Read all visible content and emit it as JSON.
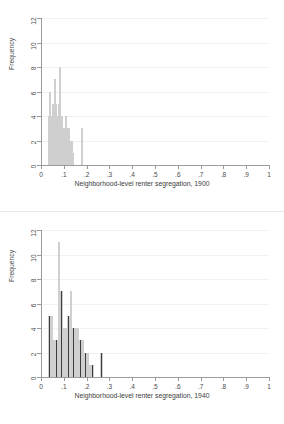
{
  "figure": {
    "background_color": "#ffffff",
    "bar_color": "#3d3d3d",
    "axis_color": "#9a9a9a",
    "grid_color": "#f1f1f1"
  },
  "panels": [
    {
      "name": "histogram-1900",
      "ylabel": "Frequency",
      "xtitle": "Neighborhood-level renter segregation, 1900"
    },
    {
      "name": "histogram-1940",
      "ylabel": "Frequency",
      "xtitle": "Neighborhood-level renter segregation, 1940"
    }
  ],
  "chart_data": [
    {
      "type": "bar",
      "title": "",
      "xlabel": "Neighborhood-level renter segregation, 1900",
      "ylabel": "Frequency",
      "xlim": [
        0,
        1
      ],
      "ylim": [
        0,
        12
      ],
      "xticks": [
        0,
        0.1,
        0.2,
        0.3,
        0.4,
        0.5,
        0.6,
        0.7,
        0.8,
        0.9,
        1
      ],
      "xtick_labels": [
        "0",
        ".1",
        ".2",
        ".3",
        ".4",
        ".5",
        ".6",
        ".7",
        ".8",
        ".9",
        "1"
      ],
      "yticks": [
        0,
        2,
        4,
        6,
        8,
        10,
        12
      ],
      "ytick_labels": [
        "0",
        "2",
        "4",
        "6",
        "8",
        "10",
        "12"
      ],
      "grid": "horizontal",
      "legend": "none",
      "bin_width": 0.00625,
      "bins": [
        {
          "x0": 0.03,
          "x1": 0.0363,
          "value": 4
        },
        {
          "x0": 0.0363,
          "x1": 0.0425,
          "value": 6
        },
        {
          "x0": 0.0425,
          "x1": 0.0488,
          "value": 4
        },
        {
          "x0": 0.0488,
          "x1": 0.055,
          "value": 5
        },
        {
          "x0": 0.055,
          "x1": 0.0613,
          "value": 7
        },
        {
          "x0": 0.0613,
          "x1": 0.0675,
          "value": 5
        },
        {
          "x0": 0.0675,
          "x1": 0.0738,
          "value": 4
        },
        {
          "x0": 0.0738,
          "x1": 0.08,
          "value": 5
        },
        {
          "x0": 0.08,
          "x1": 0.0863,
          "value": 8
        },
        {
          "x0": 0.0863,
          "x1": 0.0925,
          "value": 4
        },
        {
          "x0": 0.0925,
          "x1": 0.0988,
          "value": 3
        },
        {
          "x0": 0.0988,
          "x1": 0.105,
          "value": 3
        },
        {
          "x0": 0.105,
          "x1": 0.1113,
          "value": 4
        },
        {
          "x0": 0.1113,
          "x1": 0.1175,
          "value": 3
        },
        {
          "x0": 0.1175,
          "x1": 0.1238,
          "value": 3
        },
        {
          "x0": 0.1238,
          "x1": 0.13,
          "value": 2
        },
        {
          "x0": 0.13,
          "x1": 0.1363,
          "value": 2
        },
        {
          "x0": 0.1363,
          "x1": 0.1425,
          "value": 1
        },
        {
          "x0": 0.1763,
          "x1": 0.1825,
          "value": 3
        }
      ]
    },
    {
      "type": "bar",
      "title": "",
      "xlabel": "Neighborhood-level renter segregation, 1940",
      "ylabel": "Frequency",
      "xlim": [
        0,
        1
      ],
      "ylim": [
        0,
        12
      ],
      "xticks": [
        0,
        0.1,
        0.2,
        0.3,
        0.4,
        0.5,
        0.6,
        0.7,
        0.8,
        0.9,
        1
      ],
      "xtick_labels": [
        "0",
        ".1",
        ".2",
        ".3",
        ".4",
        ".5",
        ".6",
        ".7",
        ".8",
        ".9",
        "1"
      ],
      "yticks": [
        0,
        2,
        4,
        6,
        8,
        10,
        12
      ],
      "ytick_labels": [
        "0",
        "2",
        "4",
        "6",
        "8",
        "10",
        "12"
      ],
      "grid": "horizontal",
      "legend": "none",
      "bin_width": 0.0105,
      "bins": [
        {
          "x0": 0.032,
          "x1": 0.0425,
          "value": 5
        },
        {
          "x0": 0.0425,
          "x1": 0.053,
          "value": 5
        },
        {
          "x0": 0.053,
          "x1": 0.0635,
          "value": 3
        },
        {
          "x0": 0.0635,
          "x1": 0.074,
          "value": 3
        },
        {
          "x0": 0.074,
          "x1": 0.0845,
          "value": 11
        },
        {
          "x0": 0.0845,
          "x1": 0.095,
          "value": 7
        },
        {
          "x0": 0.095,
          "x1": 0.1055,
          "value": 4
        },
        {
          "x0": 0.1055,
          "x1": 0.116,
          "value": 4
        },
        {
          "x0": 0.116,
          "x1": 0.1265,
          "value": 5
        },
        {
          "x0": 0.1265,
          "x1": 0.137,
          "value": 7
        },
        {
          "x0": 0.137,
          "x1": 0.1475,
          "value": 4
        },
        {
          "x0": 0.1475,
          "x1": 0.158,
          "value": 4
        },
        {
          "x0": 0.158,
          "x1": 0.1685,
          "value": 4
        },
        {
          "x0": 0.1685,
          "x1": 0.179,
          "value": 3
        },
        {
          "x0": 0.179,
          "x1": 0.1895,
          "value": 3
        },
        {
          "x0": 0.1895,
          "x1": 0.2,
          "value": 2
        },
        {
          "x0": 0.2,
          "x1": 0.2105,
          "value": 2
        },
        {
          "x0": 0.2105,
          "x1": 0.221,
          "value": 1
        },
        {
          "x0": 0.221,
          "x1": 0.2315,
          "value": 1
        },
        {
          "x0": 0.26,
          "x1": 0.2705,
          "value": 2
        }
      ]
    }
  ]
}
